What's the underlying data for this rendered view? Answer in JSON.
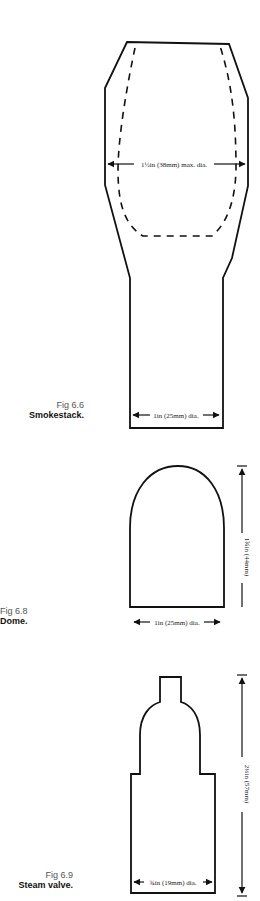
{
  "figures": [
    {
      "id": "6.6",
      "fig_label": "Fig 6.6",
      "title": "Smokestack.",
      "dimensions": {
        "max_diameter": "1½in (38mm) max. dia.",
        "base_diameter": "1in (25mm) dia."
      }
    },
    {
      "id": "6.8",
      "fig_label": "Fig 6.8",
      "title": "Dome.",
      "dimensions": {
        "height": "1¾in (44mm)",
        "base_diameter": "1in (25mm) dia."
      }
    },
    {
      "id": "6.9",
      "fig_label": "Fig 6.9",
      "title": "Steam valve.",
      "dimensions": {
        "height": "2¼in (57mm)",
        "base_diameter": "¾in (19mm) dia."
      }
    }
  ],
  "colors": {
    "line": "#111111",
    "caption_fig": "#555555",
    "background": "#ffffff"
  }
}
